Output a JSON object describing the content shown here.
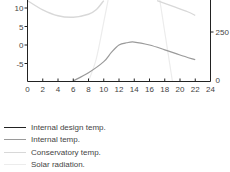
{
  "chart_data": {
    "type": "line",
    "title": "",
    "xlabel": "",
    "ylabel_left": "",
    "ylabel_right": "",
    "x_ticks": [
      0,
      2,
      4,
      6,
      8,
      10,
      12,
      14,
      16,
      18,
      20,
      22,
      24
    ],
    "xlim": [
      0,
      24
    ],
    "y_left_ticks": [
      10,
      5,
      0,
      -5
    ],
    "y_left_lim": [
      -9.7,
      12
    ],
    "y_right_ticks": [
      250,
      0
    ],
    "y_right_lim": [
      0,
      600
    ],
    "grid": false,
    "legend_position": "below",
    "series": [
      {
        "name": "Internal design temp.",
        "color": "#222222",
        "width": 1.3,
        "axis": "left",
        "x": [],
        "y": []
      },
      {
        "name": "Internal temp.",
        "color": "#9a9a9a",
        "width": 1.2,
        "axis": "left",
        "x": [
          6,
          8,
          10,
          11,
          12,
          13,
          14,
          16,
          18,
          20,
          22
        ],
        "y": [
          -9.7,
          -7.5,
          -4.5,
          -2.0,
          0.0,
          0.6,
          0.8,
          0.0,
          -1.3,
          -2.7,
          -4.0
        ]
      },
      {
        "name": "Conservatory temp.",
        "color": "#d8d8d8",
        "width": 1.4,
        "axis": "left",
        "x": [
          0,
          2,
          4,
          6,
          8,
          9,
          10
        ],
        "y": [
          12,
          9.5,
          7.9,
          7.5,
          8.3,
          9.5,
          12
        ]
      },
      {
        "name": "Solar radiation.",
        "color": "#ececec",
        "width": 1.2,
        "axis": "right",
        "x": [
          8,
          9,
          10,
          11,
          11.5
        ],
        "y": [
          0,
          110,
          300,
          500,
          600
        ]
      }
    ],
    "extra_curves": [
      {
        "name": "Conservatory temp. (afternoon)",
        "color": "#d8d8d8",
        "axis": "left",
        "x": [
          17,
          19,
          21,
          22
        ],
        "y": [
          12,
          10.5,
          9.0,
          8.0
        ]
      },
      {
        "name": "Solar radiation. (afternoon)",
        "color": "#ececec",
        "axis": "right",
        "x": [
          16.5,
          17,
          18,
          19
        ],
        "y": [
          600,
          500,
          250,
          0
        ]
      }
    ]
  },
  "legend": [
    {
      "label": "Internal design temp."
    },
    {
      "label": "Internal temp."
    },
    {
      "label": "Conservatory temp."
    },
    {
      "label": "Solar radiation."
    }
  ]
}
